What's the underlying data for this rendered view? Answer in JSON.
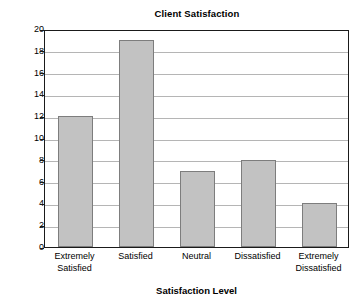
{
  "chart_data": {
    "type": "bar",
    "title": "Client Satisfaction",
    "xlabel": "Satisfaction Level",
    "ylabel": "Number of Clients",
    "categories": [
      "Extremely Satisfied",
      "Satisfied",
      "Neutral",
      "Dissatisfied",
      "Extremely Dissatisfied"
    ],
    "category_lines": [
      [
        "Extremely",
        "Satisfied"
      ],
      [
        "Satisfied"
      ],
      [
        "Neutral"
      ],
      [
        "Dissatisfied"
      ],
      [
        "Extremely",
        "Dissatisfied"
      ]
    ],
    "values": [
      12,
      19,
      7,
      8,
      4
    ],
    "ylim": [
      0,
      20
    ],
    "ytick_step": 2,
    "yticks": [
      0,
      2,
      4,
      6,
      8,
      10,
      12,
      14,
      16,
      18,
      20
    ],
    "ytick_labels": [
      "0",
      "2",
      "4",
      "6",
      "8",
      "10",
      "12",
      "14",
      "16",
      "18",
      "20"
    ],
    "grid": true,
    "grid_axis": "y",
    "legend": false,
    "bar_fill_color": "#c2c2c2",
    "bar_edge_color": "#7d7d7d",
    "frame_color": "#1a1a1a",
    "gridline_color": "#b5b5b5",
    "background_color": "#ffffff"
  }
}
